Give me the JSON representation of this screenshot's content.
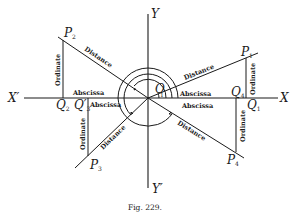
{
  "figure": {
    "caption": "Fig. 229.",
    "axes": {
      "x_pos": "X",
      "x_neg": "X′",
      "y_pos": "Y",
      "y_neg": "Y′",
      "origin": "O"
    },
    "points": [
      {
        "id": "P1",
        "name": "P",
        "sub": "1",
        "quadrant": "I"
      },
      {
        "id": "P2",
        "name": "P",
        "sub": "2",
        "quadrant": "II"
      },
      {
        "id": "P3",
        "name": "P",
        "sub": "3",
        "quadrant": "III"
      },
      {
        "id": "P4",
        "name": "P",
        "sub": "4",
        "quadrant": "IV"
      }
    ],
    "feet": [
      {
        "id": "Q1",
        "name": "Q",
        "sub": "1"
      },
      {
        "id": "Q2",
        "name": "Q",
        "sub": "2"
      },
      {
        "id": "Q3p",
        "name": "Q′",
        "sub": "3"
      },
      {
        "id": "Q4",
        "name": "Q",
        "sub": "4"
      }
    ],
    "segment_labels": {
      "abscissa": "Abscissa",
      "ordinate": "Ordinate",
      "distance": "Distance"
    },
    "angle_marker": "1"
  }
}
